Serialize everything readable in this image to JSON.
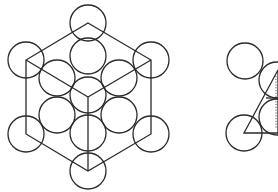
{
  "diagram": {
    "colors": {
      "stroke": "#2a2a2a",
      "background": "#ffffff",
      "dotted": "#555555"
    },
    "left_figure": {
      "name": "cube-packing",
      "radius": 18,
      "hexagon": [
        [
          88,
          23
        ],
        [
          151,
          60
        ],
        [
          151,
          134
        ],
        [
          88,
          171
        ],
        [
          26,
          134
        ],
        [
          26,
          60
        ]
      ],
      "center": [
        88,
        97
      ],
      "y_lines": [
        [
          [
            26,
            60
          ],
          [
            88,
            97
          ]
        ],
        [
          [
            151,
            60
          ],
          [
            88,
            97
          ]
        ],
        [
          [
            88,
            97
          ],
          [
            88,
            171
          ]
        ]
      ],
      "circles": [
        [
          88,
          23
        ],
        [
          26,
          60
        ],
        [
          151,
          60
        ],
        [
          26,
          134
        ],
        [
          151,
          134
        ],
        [
          88,
          171
        ],
        [
          88,
          56
        ],
        [
          57,
          78
        ],
        [
          119,
          78
        ],
        [
          88,
          95
        ],
        [
          57,
          115
        ],
        [
          119,
          115
        ],
        [
          88,
          133
        ]
      ]
    },
    "right_figure": {
      "name": "tetrahedral-packing",
      "radius": 18,
      "circles": [
        [
          245,
          61
        ],
        [
          277,
          80
        ],
        [
          277,
          117
        ],
        [
          244,
          133
        ]
      ],
      "triangle": [
        [
          244,
          133
        ],
        [
          278,
          70
        ],
        [
          278,
          133
        ]
      ],
      "horizontal_line": [
        [
          266,
          98
        ],
        [
          278,
          98
        ]
      ],
      "dotted_line": [
        [
          276,
          76
        ],
        [
          276,
          128
        ]
      ]
    }
  }
}
